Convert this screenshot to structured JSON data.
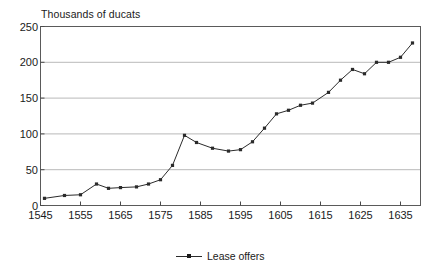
{
  "chart_data": {
    "type": "line",
    "title": "",
    "ylabel": "Thousands of ducats",
    "xlabel": "",
    "ylim": [
      0,
      250
    ],
    "xlim": [
      1545,
      1640
    ],
    "grid": true,
    "legend_position": "bottom-center",
    "y_ticks": [
      0,
      50,
      100,
      150,
      200,
      250
    ],
    "x_ticks": [
      1545,
      1555,
      1565,
      1575,
      1585,
      1595,
      1605,
      1615,
      1625,
      1635
    ],
    "series": [
      {
        "name": "Lease offers",
        "color": "#2b2b2b",
        "marker": "square",
        "x": [
          1546,
          1551,
          1555,
          1559,
          1562,
          1565,
          1569,
          1572,
          1575,
          1578,
          1581,
          1584,
          1588,
          1592,
          1595,
          1598,
          1601,
          1604,
          1607,
          1610,
          1613,
          1617,
          1620,
          1623,
          1626,
          1629,
          1632,
          1635,
          1638
        ],
        "values": [
          10,
          14,
          15,
          30,
          24,
          25,
          26,
          30,
          36,
          56,
          98,
          88,
          80,
          76,
          78,
          89,
          108,
          128,
          133,
          140,
          143,
          158,
          175,
          190,
          184,
          200,
          200,
          207,
          227
        ]
      }
    ]
  },
  "axis_title": {
    "text": "Thousands of ducats"
  },
  "legend": {
    "label": "Lease offers"
  }
}
